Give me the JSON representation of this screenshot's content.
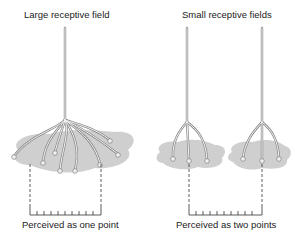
{
  "left_panel": {
    "title": "Large receptive field",
    "caption": "Perceived as one point"
  },
  "right_panel": {
    "title": "Small receptive fields",
    "caption": "Perceived as two points"
  },
  "colors": {
    "field_fill": "#cfcfcf",
    "neuron_stroke": "#8a8a8a",
    "neuron_fill": "#f2f2f2",
    "line": "#333333"
  }
}
